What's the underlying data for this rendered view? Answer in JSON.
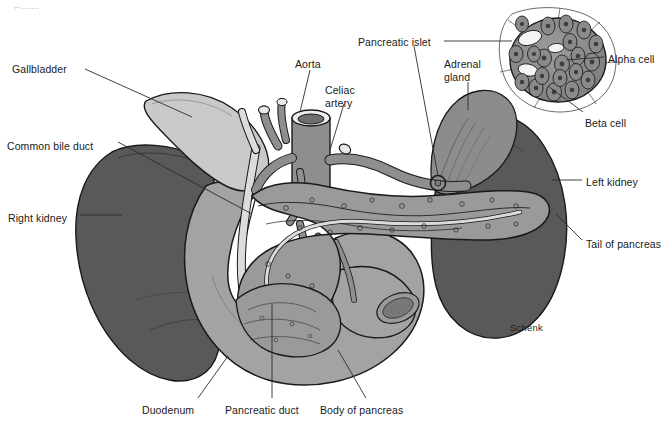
{
  "figure": {
    "background_color": "#ffffff",
    "width": 669,
    "height": 424,
    "credit": "Schenk",
    "cropped_header_text": "Figure"
  },
  "palette": {
    "kidney_dark": "#595959",
    "adrenal_gland": "#8c8c8c",
    "duodenum": "#a3a3a3",
    "gallbladder": "#c9c9c9",
    "pancreas": "#9a9a9a",
    "vessel_artery": "#8e8e8e",
    "vessel_duct": "#dcdcdc",
    "islet_cell": "#8a8a8a",
    "outline": "#1a1a1a",
    "leader_line": "#2b2b2b",
    "text": "#1a1a1a"
  },
  "labels": [
    {
      "id": "gallbladder",
      "text": "Gallbladder",
      "x": 12,
      "y": 63,
      "align": "left"
    },
    {
      "id": "common-bile-duct",
      "text": "Common bile duct",
      "x": 7,
      "y": 140,
      "align": "left"
    },
    {
      "id": "right-kidney",
      "text": "Right kidney",
      "x": 8,
      "y": 212,
      "align": "left"
    },
    {
      "id": "aorta",
      "text": "Aorta",
      "x": 295,
      "y": 58,
      "align": "left"
    },
    {
      "id": "celiac-artery",
      "text": "Celiac\nartery",
      "x": 325,
      "y": 84,
      "align": "left"
    },
    {
      "id": "pancreatic-islet",
      "text": "Pancreatic islet",
      "x": 358,
      "y": 36,
      "align": "left"
    },
    {
      "id": "adrenal-gland",
      "text": "Adrenal\ngland",
      "x": 444,
      "y": 58,
      "align": "left"
    },
    {
      "id": "alpha-cell",
      "text": "Alpha cell",
      "x": 608,
      "y": 53,
      "align": "left"
    },
    {
      "id": "beta-cell",
      "text": "Beta cell",
      "x": 585,
      "y": 117,
      "align": "left"
    },
    {
      "id": "left-kidney",
      "text": "Left kidney",
      "x": 586,
      "y": 176,
      "align": "left"
    },
    {
      "id": "tail-of-pancreas",
      "text": "Tail of pancreas",
      "x": 586,
      "y": 238,
      "align": "left"
    },
    {
      "id": "duodenum",
      "text": "Duodenum",
      "x": 142,
      "y": 404,
      "align": "left"
    },
    {
      "id": "pancreatic-duct",
      "text": "Pancreatic duct",
      "x": 225,
      "y": 404,
      "align": "left"
    },
    {
      "id": "body-of-pancreas",
      "text": "Body of pancreas",
      "x": 320,
      "y": 404,
      "align": "left"
    }
  ],
  "structures": [
    {
      "id": "right-kidney",
      "name": "Right kidney",
      "fill": "kidney_dark"
    },
    {
      "id": "left-kidney",
      "name": "Left kidney",
      "fill": "kidney_dark"
    },
    {
      "id": "adrenal-gland",
      "name": "Adrenal gland",
      "fill": "adrenal_gland"
    },
    {
      "id": "gallbladder",
      "name": "Gallbladder",
      "fill": "gallbladder"
    },
    {
      "id": "duodenum",
      "name": "Duodenum",
      "fill": "duodenum"
    },
    {
      "id": "pancreas",
      "name": "Pancreas",
      "fill": "pancreas"
    },
    {
      "id": "aorta",
      "name": "Aorta",
      "fill": "vessel_artery"
    },
    {
      "id": "celiac-artery",
      "name": "Celiac artery",
      "fill": "vessel_artery"
    },
    {
      "id": "common-bile-duct",
      "name": "Common bile duct",
      "fill": "vessel_duct"
    },
    {
      "id": "pancreatic-duct",
      "name": "Pancreatic duct",
      "fill": "vessel_duct"
    },
    {
      "id": "islet-inset",
      "name": "Pancreatic islet",
      "fill": "islet_cell"
    }
  ]
}
